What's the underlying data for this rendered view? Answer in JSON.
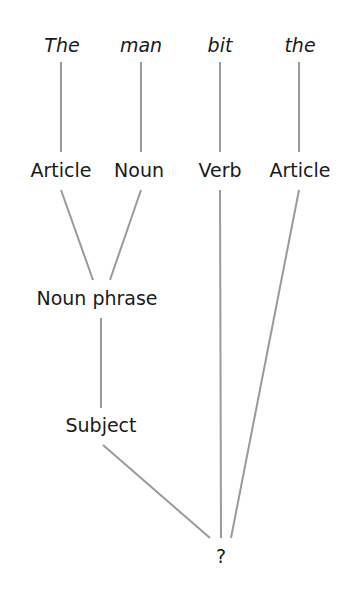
{
  "diagram": {
    "type": "parse-tree",
    "line_color": "#9a9a9a",
    "text_color": "#1a1a1a",
    "words": [
      {
        "label": "The",
        "x": 62,
        "y": 36
      },
      {
        "label": "man",
        "x": 141,
        "y": 36
      },
      {
        "label": "bit",
        "x": 220,
        "y": 36
      },
      {
        "label": "the",
        "x": 300,
        "y": 36
      }
    ],
    "pos_tags": [
      {
        "label": "Article",
        "x": 61,
        "y": 161
      },
      {
        "label": "Noun",
        "x": 139,
        "y": 161
      },
      {
        "label": "Verb",
        "x": 220,
        "y": 161
      },
      {
        "label": "Article",
        "x": 300,
        "y": 161
      }
    ],
    "phrases": {
      "noun_phrase": {
        "label": "Noun phrase",
        "x": 97,
        "y": 289
      },
      "subject": {
        "label": "Subject",
        "x": 101,
        "y": 416
      },
      "root": {
        "label": "?",
        "x": 221,
        "y": 547
      }
    },
    "edges": [
      {
        "from": "The",
        "to": "Article",
        "x1": 61,
        "y1": 62,
        "x2": 61,
        "y2": 152
      },
      {
        "from": "man",
        "to": "Noun",
        "x1": 141,
        "y1": 62,
        "x2": 141,
        "y2": 152
      },
      {
        "from": "bit",
        "to": "Verb",
        "x1": 220,
        "y1": 62,
        "x2": 220,
        "y2": 152
      },
      {
        "from": "the",
        "to": "Article",
        "x1": 299,
        "y1": 62,
        "x2": 299,
        "y2": 152
      },
      {
        "from": "Article",
        "to": "Noun phrase",
        "x1": 61,
        "y1": 190,
        "x2": 93,
        "y2": 280
      },
      {
        "from": "Noun",
        "to": "Noun phrase",
        "x1": 141,
        "y1": 190,
        "x2": 110,
        "y2": 280
      },
      {
        "from": "Noun phrase",
        "to": "Subject",
        "x1": 101,
        "y1": 318,
        "x2": 101,
        "y2": 408
      },
      {
        "from": "Subject",
        "to": "?",
        "x1": 103,
        "y1": 445,
        "x2": 210,
        "y2": 538
      },
      {
        "from": "Verb",
        "to": "?",
        "x1": 220,
        "y1": 190,
        "x2": 221,
        "y2": 538
      },
      {
        "from": "Article",
        "to": "?",
        "x1": 299,
        "y1": 190,
        "x2": 231,
        "y2": 538
      }
    ]
  }
}
